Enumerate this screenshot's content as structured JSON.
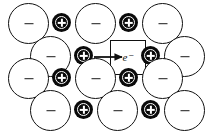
{
  "figure": {
    "name": "ionic-lattice-f-center-diagram",
    "width": 210,
    "height": 135,
    "background": "#ffffff",
    "ink_color": "#111111"
  },
  "legend": {
    "anion_symbol": "−",
    "cation_symbol": "+",
    "electron_label": "e⁻"
  },
  "annotation": {
    "electron_label": "e⁻",
    "arrow_name": "electron-capture-arrow"
  },
  "lattice": {
    "rows": [
      {
        "row_index": 1,
        "y": 3,
        "ions": [
          {
            "type": "anion",
            "charge": "−",
            "x": 8
          },
          {
            "type": "cation",
            "charge": "+",
            "x": 52,
            "y": 13
          },
          {
            "type": "anion",
            "charge": "−",
            "x": 75
          },
          {
            "type": "cation",
            "charge": "+",
            "x": 119,
            "y": 13
          },
          {
            "type": "anion",
            "charge": "−",
            "x": 142
          }
        ]
      },
      {
        "row_index": 2,
        "y": 36,
        "ions": [
          {
            "type": "anion",
            "charge": "−",
            "x": 30
          },
          {
            "type": "cation",
            "charge": "+",
            "x": 74,
            "y": 46
          },
          {
            "type": "vacancy",
            "charge": "e⁻",
            "x": 110
          },
          {
            "type": "cation",
            "charge": "+",
            "x": 141,
            "y": 46
          },
          {
            "type": "anion",
            "charge": "−",
            "x": 164
          }
        ]
      },
      {
        "row_index": 3,
        "y": 58,
        "ions": [
          {
            "type": "anion",
            "charge": "−",
            "x": 8
          },
          {
            "type": "cation",
            "charge": "+",
            "x": 52,
            "y": 68
          },
          {
            "type": "anion",
            "charge": "−",
            "x": 75
          },
          {
            "type": "cation",
            "charge": "+",
            "x": 119,
            "y": 68
          },
          {
            "type": "anion",
            "charge": "−",
            "x": 142
          }
        ]
      },
      {
        "row_index": 4,
        "y": 90,
        "ions": [
          {
            "type": "anion",
            "charge": "−",
            "x": 30
          },
          {
            "type": "cation",
            "charge": "+",
            "x": 74,
            "y": 100
          },
          {
            "type": "anion",
            "charge": "−",
            "x": 97
          },
          {
            "type": "cation",
            "charge": "+",
            "x": 141,
            "y": 100
          },
          {
            "type": "anion",
            "charge": "−",
            "x": 164
          }
        ]
      }
    ]
  }
}
